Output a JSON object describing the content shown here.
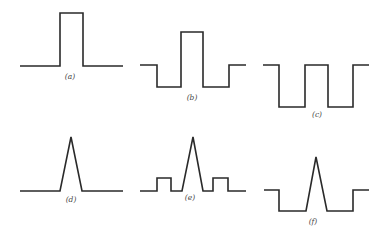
{
  "figure": {
    "panels": [
      {
        "id": "a",
        "label": "(a)",
        "shape": "single rectangular pulse on flat baseline",
        "points": "20,66 60,66 60,13 83,13 83,66 123,66",
        "label_pos": [
          70,
          79
        ]
      },
      {
        "id": "b",
        "label": "(b)",
        "shape": "rectangular pulse with negative side lobes",
        "points": "140,65 157,65 157,87 181,87 181,32 203,32 203,87 229,87 229,65 246,65",
        "label_pos": [
          192,
          100
        ]
      },
      {
        "id": "c",
        "label": "(c)",
        "shape": "square wave (two negative rectangular dips)",
        "points": "263,65 279,65 279,107 305,107 305,65 328,65 328,107 353,107 353,65 369,65",
        "label_pos": [
          317,
          117
        ]
      },
      {
        "id": "d",
        "label": "(d)",
        "shape": "single triangular pulse on flat baseline",
        "points": "20,191 60,191 71,137 82,191 123,191",
        "label_pos": [
          71,
          202
        ]
      },
      {
        "id": "e",
        "label": "(e)",
        "shape": "triangular pulse with small rectangular side bumps",
        "points": "140,191 157,191 157,178 171,178 171,191 182,191 193,137 203,191 213,191 213,178 228,178 228,191 246,191",
        "label_pos": [
          190,
          200
        ]
      },
      {
        "id": "f",
        "label": "(f)",
        "shape": "triangular pulse within a negative rectangular well",
        "points": "264,190 279,190 279,211 306,211 316,157 327,211 353,211 353,190 369,190",
        "label_pos": [
          313,
          224
        ]
      }
    ]
  }
}
